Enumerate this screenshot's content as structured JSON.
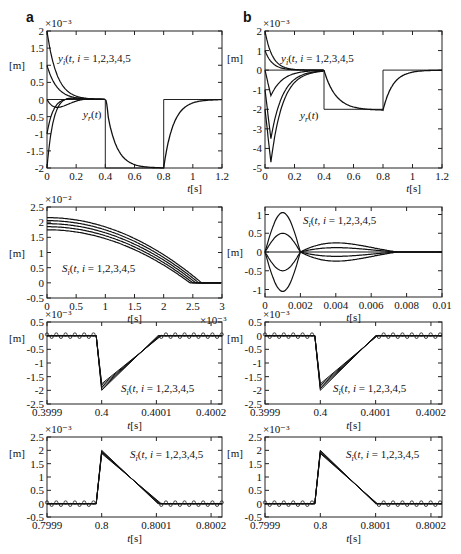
{
  "figure": {
    "panel_letters": [
      "a",
      "b"
    ],
    "unit_label": "[m]",
    "xlabel": "t[s]"
  },
  "chart_data": [
    {
      "id": "a1",
      "type": "line",
      "column": "a",
      "exponent": "×10⁻³",
      "xlabel": "t[s]",
      "ylabel": "[m]",
      "xlim": [
        0,
        1.2
      ],
      "ylim": [
        -2,
        2
      ],
      "xticks": [
        "0",
        "0.2",
        "0.4",
        "0.6",
        "0.8",
        "1",
        "1.2"
      ],
      "yticks": [
        "2",
        "1.5",
        "1",
        "0.5",
        "0",
        "-0.5",
        "-1",
        "-1.5",
        "-2"
      ],
      "annotations": [
        "y_i(t), i = 1,2,3,4,5",
        "y_r(t)"
      ],
      "series": [
        {
          "name": "y_r(t)",
          "x": [
            0,
            0.4,
            0.4,
            0.8,
            0.8,
            1.2
          ],
          "values": [
            0,
            0,
            -2,
            -2,
            0,
            0
          ]
        },
        {
          "name": "y_1(t)",
          "initial": 2
        },
        {
          "name": "y_2(t)",
          "initial": 1
        },
        {
          "name": "y_3(t)",
          "initial": 0
        },
        {
          "name": "y_4(t)",
          "initial": -1
        },
        {
          "name": "y_5(t)",
          "initial": -2
        }
      ]
    },
    {
      "id": "b1",
      "type": "line",
      "column": "b",
      "exponent": "×10⁻³",
      "xlabel": "t[s]",
      "ylabel": "[m]",
      "xlim": [
        0,
        1.2
      ],
      "ylim": [
        -5,
        2
      ],
      "xticks": [
        "0",
        "0.2",
        "0.4",
        "0.6",
        "0.8",
        "1",
        "1.2"
      ],
      "yticks": [
        "2",
        "1",
        "0",
        "-1",
        "-2",
        "-3",
        "-4",
        "-5"
      ],
      "annotations": [
        "y_i(t), i = 1,2,3,4,5",
        "y_r(t)"
      ],
      "series": [
        {
          "name": "y_r(t)",
          "x": [
            0,
            0.4,
            0.4,
            0.8,
            0.8,
            1.2
          ],
          "values": [
            0,
            0,
            -2,
            -2,
            0,
            0
          ]
        },
        {
          "name": "y_i(t) minima",
          "values": [
            0,
            -0.3,
            -1.3,
            -3.5,
            -4.7
          ]
        }
      ]
    },
    {
      "id": "a2",
      "type": "line",
      "column": "a",
      "exponent": "×10⁻²",
      "x_exponent": "×10⁻³",
      "xlabel": "t[s]",
      "ylabel": "[m]",
      "xlim": [
        0,
        3
      ],
      "ylim": [
        -0.5,
        2.5
      ],
      "xticks": [
        "0",
        "0.5",
        "1",
        "1.5",
        "2",
        "2.5",
        "3"
      ],
      "yticks": [
        "2.5",
        "2",
        "1.5",
        "1",
        "0.5",
        "0",
        "-0.5"
      ],
      "annotations": [
        "S_i(t), i = 1,2,3,4,5"
      ],
      "series": [
        {
          "name": "S_1(t)",
          "initial": 2.15,
          "zero_at": 2.65
        },
        {
          "name": "S_2(t)",
          "initial": 2.05,
          "zero_at": 2.6
        },
        {
          "name": "S_3(t)",
          "initial": 1.95,
          "zero_at": 2.55
        },
        {
          "name": "S_4(t)",
          "initial": 1.85,
          "zero_at": 2.5
        },
        {
          "name": "S_5(t)",
          "initial": 1.75,
          "zero_at": 2.45
        }
      ]
    },
    {
      "id": "b2",
      "type": "line",
      "column": "b",
      "xlabel": "t[s]",
      "ylabel": "[m]",
      "xlim": [
        0,
        0.01
      ],
      "ylim": [
        -1.2,
        1.2
      ],
      "xticks": [
        "0",
        "0.002",
        "0.004",
        "0.006",
        "0.008",
        "0.01"
      ],
      "yticks": [
        "1",
        "0.5",
        "0",
        "-0.5",
        "-1"
      ],
      "annotations": [
        "S_i(t), i = 1,2,3,4,5"
      ],
      "series": [
        {
          "name": "S_1(t)",
          "peak": 1.05
        },
        {
          "name": "S_2(t)",
          "peak": 0.5
        },
        {
          "name": "S_3(t)",
          "peak": 0
        },
        {
          "name": "S_4(t)",
          "peak": -0.5
        },
        {
          "name": "S_5(t)",
          "peak": -1.05
        }
      ]
    },
    {
      "id": "a3",
      "type": "line",
      "column": "a",
      "exponent": "×10⁻³",
      "xlabel": "t[s]",
      "ylabel": "[m]",
      "xlim": [
        0.3999,
        0.40022
      ],
      "ylim": [
        -2.5,
        0.5
      ],
      "xticks": [
        "0.3999",
        "0.4",
        "0.4001",
        "0.4002"
      ],
      "yticks": [
        "0.5",
        "0",
        "-0.5",
        "-1",
        "-1.5",
        "-2",
        "-2.5"
      ],
      "annotations": [
        "S_i(t), i = 1,2,3,4,5"
      ],
      "series": [
        {
          "name": "S_i(t)",
          "x": [
            0.3999,
            0.39999,
            0.4,
            0.400103,
            0.40022
          ],
          "values": [
            0,
            0,
            -2.0,
            0,
            0
          ]
        }
      ]
    },
    {
      "id": "b3",
      "type": "line",
      "column": "b",
      "exponent": "×10⁻³",
      "xlabel": "t[s]",
      "ylabel": "[m]",
      "xlim": [
        0.3999,
        0.40022
      ],
      "ylim": [
        -2.5,
        0.5
      ],
      "xticks": [
        "0.3999",
        "0.4",
        "0.4001",
        "0.4002"
      ],
      "yticks": [
        "0.5",
        "0",
        "-0.5",
        "-1",
        "-1.5",
        "-2",
        "-2.5"
      ],
      "annotations": [
        "S_i(t), i = 1,2,3,4,5"
      ],
      "series": [
        {
          "name": "S_i(t)",
          "x": [
            0.3999,
            0.39999,
            0.4,
            0.4001,
            0.40022
          ],
          "values": [
            0,
            0,
            -2.0,
            0,
            0
          ]
        }
      ]
    },
    {
      "id": "a4",
      "type": "line",
      "column": "a",
      "exponent": "×10⁻³",
      "xlabel": "t[s]",
      "ylabel": "[m]",
      "xlim": [
        0.7999,
        0.80022
      ],
      "ylim": [
        -0.5,
        2.5
      ],
      "xticks": [
        "0.7999",
        "0.8",
        "0.8001",
        "0.8002"
      ],
      "yticks": [
        "2.5",
        "2",
        "1.5",
        "1",
        "0.5",
        "0",
        "-0.5"
      ],
      "annotations": [
        "S_i(t), i = 1,2,3,4,5"
      ],
      "series": [
        {
          "name": "S_i(t)",
          "x": [
            0.7999,
            0.79999,
            0.8,
            0.800103,
            0.80022
          ],
          "values": [
            0,
            0,
            2.0,
            0,
            0
          ]
        }
      ]
    },
    {
      "id": "b4",
      "type": "line",
      "column": "b",
      "exponent": "×10⁻³",
      "xlabel": "t[s]",
      "ylabel": "[m]",
      "xlim": [
        0.7999,
        0.80022
      ],
      "ylim": [
        -0.5,
        2.5
      ],
      "xticks": [
        "0.7999",
        "0.8",
        "0.8001",
        "0.8002"
      ],
      "yticks": [
        "2.5",
        "2",
        "1.5",
        "1",
        "0.5",
        "0",
        "-0.5"
      ],
      "annotations": [
        "S_i(t), i = 1,2,3,4,5"
      ],
      "series": [
        {
          "name": "S_i(t)",
          "x": [
            0.7999,
            0.79999,
            0.8,
            0.8001,
            0.80022
          ],
          "values": [
            0,
            0,
            2.0,
            0,
            0
          ]
        }
      ]
    }
  ]
}
